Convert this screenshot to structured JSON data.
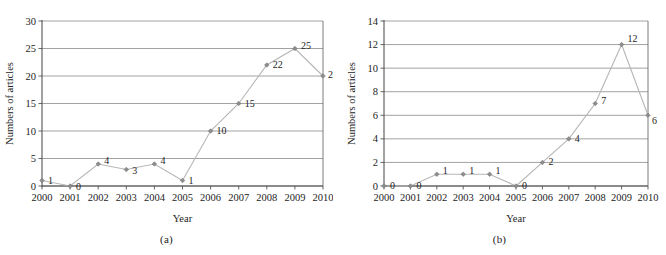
{
  "figure": {
    "panels": [
      {
        "caption": "(a)",
        "chart_data": {
          "type": "line",
          "title": "",
          "xlabel": "Year",
          "ylabel": "Numbers of articles",
          "categories": [
            "2000",
            "2001",
            "2002",
            "2003",
            "2004",
            "2005",
            "2006",
            "2007",
            "2008",
            "2009",
            "2010"
          ],
          "values": [
            1,
            0,
            4,
            3,
            4,
            1,
            10,
            15,
            22,
            25,
            20
          ],
          "point_labels": [
            "1",
            "0",
            "4",
            "3",
            "4",
            "1",
            "10",
            "15",
            "22",
            "25",
            "20"
          ],
          "xlim": [
            2000,
            2010
          ],
          "ylim": [
            0,
            30
          ],
          "yticks": [
            0,
            5,
            10,
            15,
            20,
            25,
            30
          ],
          "ytick_labels": [
            "0",
            "5",
            "10",
            "15",
            "20",
            "25",
            "30"
          ],
          "xticks": [
            "2000",
            "2001",
            "2002",
            "2003",
            "2004",
            "2005",
            "2006",
            "2007",
            "2008",
            "2009",
            "2010"
          ],
          "grid": "horizontal",
          "legend": "none",
          "marker": "diamond",
          "line_color": "#b6b6b6",
          "marker_color": "#8d8d8d"
        }
      },
      {
        "caption": "(b)",
        "chart_data": {
          "type": "line",
          "title": "",
          "xlabel": "Year",
          "ylabel": "Numbers of articles",
          "categories": [
            "2000",
            "2001",
            "2002",
            "2003",
            "2004",
            "2005",
            "2006",
            "2007",
            "2008",
            "2009",
            "2010"
          ],
          "values": [
            0,
            0,
            1,
            1,
            1,
            0,
            2,
            4,
            7,
            12,
            6
          ],
          "point_labels": [
            "0",
            "0",
            "1",
            "1",
            "1",
            "0",
            "2",
            "4",
            "7",
            "12",
            "6"
          ],
          "xlim": [
            2000,
            2010
          ],
          "ylim": [
            0,
            14
          ],
          "yticks": [
            0,
            2,
            4,
            6,
            8,
            10,
            12,
            14
          ],
          "ytick_labels": [
            "0",
            "2",
            "4",
            "6",
            "8",
            "10",
            "12",
            "14"
          ],
          "xticks": [
            "2000",
            "2001",
            "2002",
            "2003",
            "2004",
            "2005",
            "2006",
            "2007",
            "2008",
            "2009",
            "2010"
          ],
          "grid": "horizontal",
          "legend": "none",
          "marker": "diamond",
          "line_color": "#b6b6b6",
          "marker_color": "#8d8d8d"
        }
      }
    ]
  }
}
